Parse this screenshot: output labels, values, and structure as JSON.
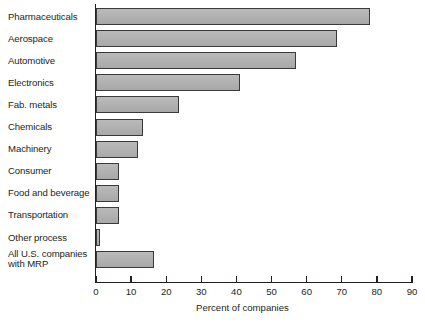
{
  "chart_data": {
    "type": "bar",
    "orientation": "horizontal",
    "title": "",
    "xlabel": "Percent of companies",
    "ylabel": "",
    "xlim": [
      0,
      90
    ],
    "xticks": [
      0,
      10,
      20,
      30,
      40,
      50,
      60,
      70,
      80,
      90
    ],
    "grid": false,
    "legend": null,
    "categories": [
      "Pharmaceuticals",
      "Aerospace",
      "Automotive",
      "Electronics",
      "Fab. metals",
      "Chemicals",
      "Machinery",
      "Consumer",
      "Food and beverage",
      "Transportation",
      "Other process",
      "All U.S. companies\nwith MRP"
    ],
    "values": [
      78,
      68.5,
      57,
      41,
      23.5,
      13.5,
      12,
      6.5,
      6.5,
      6.5,
      1,
      16.5
    ],
    "bar_fill": "#b2b2b2",
    "bar_edge": "#3a3a3a",
    "axis_color": "#231f20"
  },
  "axis": {
    "x_title": "Percent of companies",
    "tick_labels": [
      "0",
      "10",
      "20",
      "30",
      "40",
      "50",
      "60",
      "70",
      "80",
      "90"
    ]
  }
}
